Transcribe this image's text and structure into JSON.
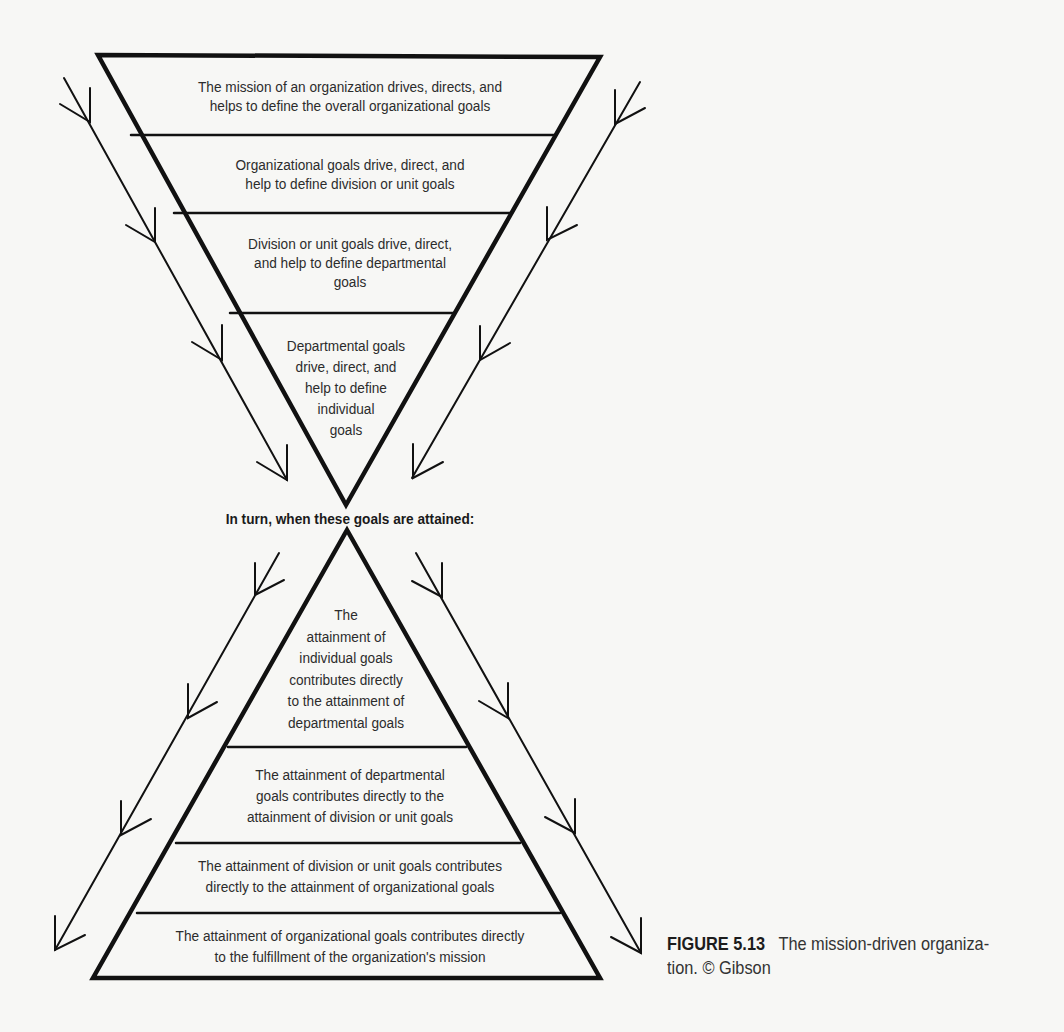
{
  "diagram": {
    "top_triangle": {
      "orientation": "inverted",
      "sections": [
        {
          "lines": [
            "The mission of an organization drives, directs, and",
            "helps to define  the overall organizational goals"
          ]
        },
        {
          "lines": [
            "Organizational goals drive, direct, and",
            "help to define division or unit goals"
          ]
        },
        {
          "lines": [
            "Division or unit goals drive, direct,",
            "and help to define departmental",
            "goals"
          ]
        },
        {
          "lines": [
            "Departmental goals",
            "drive, direct, and",
            "help to define",
            "individual",
            "goals"
          ]
        }
      ]
    },
    "transition_label": "In turn, when these goals are attained:",
    "bottom_triangle": {
      "orientation": "upright",
      "sections": [
        {
          "lines": [
            "The",
            "attainment of",
            "individual goals",
            "contributes directly",
            "to the attainment of",
            "departmental goals"
          ]
        },
        {
          "lines": [
            "The attainment of departmental",
            "goals contributes directly to the",
            "attainment of division or unit goals"
          ]
        },
        {
          "lines": [
            "The attainment of division or unit goals contributes",
            "directly to the attainment of organizational goals"
          ]
        },
        {
          "lines": [
            "The attainment of organizational goals contributes directly",
            "to the fulfillment of the organization's mission"
          ]
        }
      ]
    },
    "arrows": {
      "top_left": "downward-flow-arrow",
      "top_right": "downward-flow-arrow",
      "bottom_left": "downward-flow-arrow",
      "bottom_right": "downward-flow-arrow"
    },
    "colors": {
      "line": "#111111",
      "background": "#f7f7f5",
      "text": "#2c2c2c"
    }
  },
  "caption": {
    "figure_number": "FIGURE 5.13",
    "text_line1": "The mission-driven organiza-",
    "text_line2": "tion. © Gibson"
  }
}
